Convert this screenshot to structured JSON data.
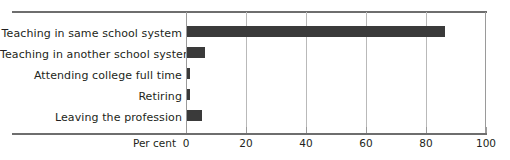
{
  "chart_data": {
    "type": "bar",
    "orientation": "horizontal",
    "title": "",
    "xlabel": "Per cent",
    "ylabel": "",
    "categories": [
      "Teaching in same school system",
      "Teaching in another school system",
      "Attending college full time",
      "Retiring",
      "Leaving the profession"
    ],
    "values": [
      86,
      6,
      1,
      1,
      5
    ],
    "xlim": [
      0,
      100
    ],
    "xticks": [
      0,
      20,
      40,
      60,
      80,
      100
    ],
    "xtick_labels": [
      "0",
      "20",
      "40",
      "60",
      "80",
      "100"
    ],
    "grid": "vertical",
    "legend": null,
    "bar_color": "#3a3a3a",
    "grid_color": "#b9b9b9",
    "rule_color": "#6e6e6e"
  }
}
